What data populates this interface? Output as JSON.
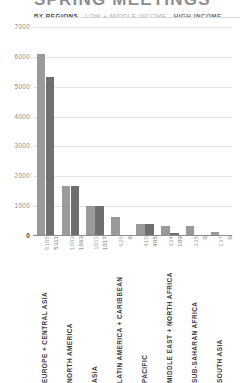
{
  "header": {
    "title": "SPRING MEETINGS",
    "legend": {
      "by_regions": "BY REGIONS",
      "low_middle_income": "LOW + MIDDLE INCOME",
      "high_income": "HIGH INCOME"
    }
  },
  "colors": {
    "low_middle_income": "#9a9a9a",
    "high_income": "#6f6f6f",
    "gridline": "#e4e4e4",
    "axis": "#8d8d8d",
    "title": "#8e8e8e"
  },
  "chart_data": {
    "type": "bar",
    "title": "SPRING MEETINGS",
    "subtitle": "BY REGIONS",
    "xlabel": "",
    "ylabel": "",
    "ylim": [
      0,
      7000
    ],
    "ytick_values": [
      7000,
      6000,
      5000,
      4000,
      3000,
      2000,
      1000,
      0
    ],
    "ytick_labels": [
      "7000",
      "6000",
      "5000",
      "4000",
      "3000",
      "2000",
      "1000",
      "0"
    ],
    "grid": true,
    "legend_position": "top",
    "categories": [
      "EUROPE + CENTRAL ASIA",
      "NORTH AMERICA",
      "ASIA",
      "LATIN AMERICA + CARIBBEAN",
      "PACIFIC",
      "MIDDLE EAST + NORTH AFRICA",
      "SUB-SAHARAN AFRICA",
      "SOUTH ASIA"
    ],
    "series": [
      {
        "name": "LOW + MIDDLE INCOME",
        "color": "#9a9a9a",
        "values": [
          6105,
          1663,
          1011,
          626,
          410,
          334,
          336,
          137
        ],
        "labels": [
          "6105",
          "1663",
          "1011",
          "626",
          "410",
          "334",
          "336",
          "137"
        ]
      },
      {
        "name": "HIGH INCOME",
        "color": "#6f6f6f",
        "values": [
          5311,
          1663,
          1017,
          9,
          405,
          109,
          0,
          0
        ],
        "labels": [
          "5311",
          "1663",
          "1017",
          "9",
          "405",
          "109",
          "0",
          "0"
        ]
      }
    ]
  }
}
